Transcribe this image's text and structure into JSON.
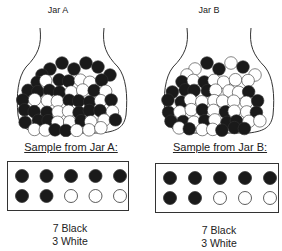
{
  "jars": [
    {
      "title": "Jar A",
      "sample_title": "Sample from Jar A:",
      "sample": [
        "black",
        "black",
        "black",
        "black",
        "black",
        "black",
        "black",
        "white",
        "white",
        "white"
      ],
      "counts": {
        "black": "7 Black",
        "white": "3 White"
      }
    },
    {
      "title": "Jar B",
      "sample_title": "Sample from Jar B:",
      "sample": [
        "black",
        "black",
        "black",
        "black",
        "black",
        "black",
        "black",
        "white",
        "white",
        "white"
      ],
      "counts": {
        "black": "7 Black",
        "white": "3 White"
      }
    }
  ],
  "colors": {
    "black": "#1a1a1a",
    "white": "#ffffff",
    "outline": "#333333"
  }
}
